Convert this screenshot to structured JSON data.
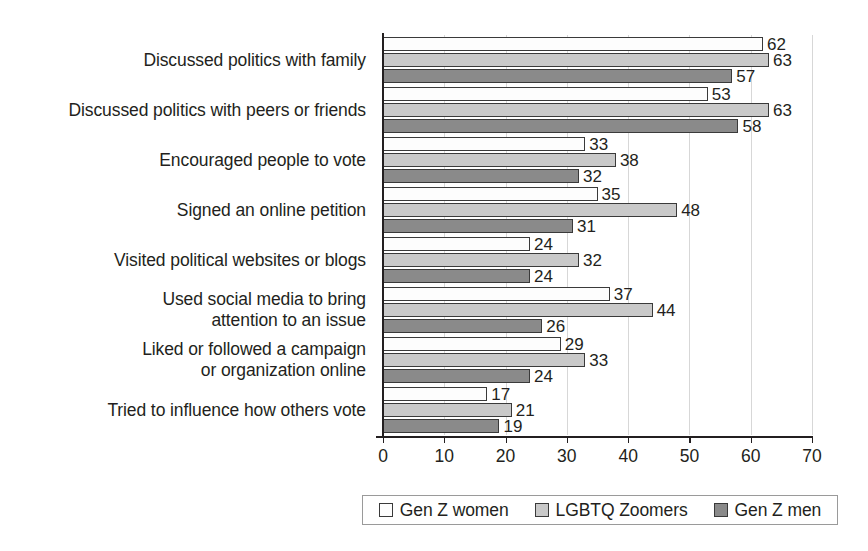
{
  "chart_data": {
    "type": "bar",
    "orientation": "horizontal",
    "title": "",
    "subtitle": "",
    "xlabel": "",
    "ylabel": "",
    "xlim": [
      0,
      70
    ],
    "xticks": [
      "0",
      "10",
      "20",
      "30",
      "40",
      "50",
      "60",
      "70"
    ],
    "grid": "vertical-dotted",
    "legend_position": "bottom",
    "categories": [
      "Discussed politics with family",
      "Discussed politics with peers or friends",
      "Encouraged people to vote",
      "Signed an online petition",
      "Visited political websites or blogs",
      "Used social media to bring\nattention to an issue",
      "Liked or followed a campaign\nor organization online",
      "Tried to influence how others vote"
    ],
    "series": [
      {
        "name": "Gen Z women",
        "color": "#fdfdfd",
        "values": [
          62,
          53,
          33,
          35,
          24,
          37,
          29,
          17
        ]
      },
      {
        "name": "LGBTQ Zoomers",
        "color": "#c9c9c9",
        "values": [
          63,
          63,
          38,
          48,
          32,
          44,
          33,
          21
        ]
      },
      {
        "name": "Gen Z men",
        "color": "#8a8a8a",
        "values": [
          57,
          58,
          32,
          31,
          24,
          26,
          24,
          19
        ]
      }
    ]
  },
  "legend": {
    "items": [
      {
        "label": "Gen Z women",
        "swatch": "white-square-icon"
      },
      {
        "label": "LGBTQ Zoomers",
        "swatch": "light-gray-square-icon"
      },
      {
        "label": "Gen Z men",
        "swatch": "dark-gray-square-icon"
      }
    ]
  }
}
